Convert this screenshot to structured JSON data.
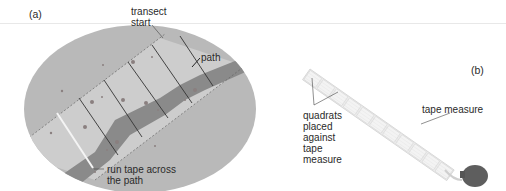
{
  "figure": {
    "panels": [
      {
        "id": "a",
        "label": "(a)",
        "annotations": {
          "transect_start": [
            "transect",
            "start"
          ],
          "path": "path",
          "run_tape": [
            "run tape across",
            "the path"
          ]
        },
        "elements": {
          "area": "oval field",
          "transect_strip": "dashed-boundary strip across the path",
          "quadrat_dividers": 5,
          "tape": "white line across the path"
        }
      },
      {
        "id": "b",
        "label": "(b)",
        "annotations": {
          "quadrats": [
            "quadrats",
            "placed",
            "against",
            "tape",
            "measure"
          ],
          "tape_measure": "tape measure"
        },
        "elements": {
          "quadrat_count": 11,
          "tape_measure_reel": "dark grey reel"
        }
      }
    ],
    "colors": {
      "field": "#b8b8b8",
      "strip": "#cfcfcf",
      "path": "#808080",
      "quadrat_fill": "#f0f0f0",
      "quadrat_edge": "#c8c8c8",
      "reel": "#5e5e5e",
      "text": "#2a2a2a"
    }
  }
}
